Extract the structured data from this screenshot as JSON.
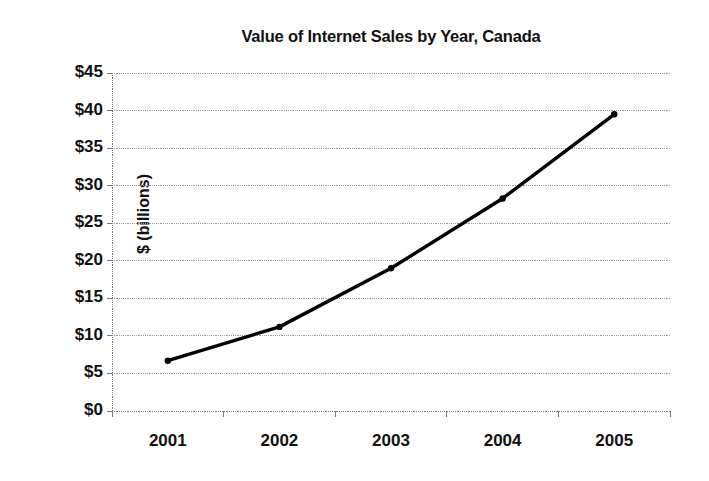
{
  "chart_data": {
    "type": "line",
    "title": "Value of Internet Sales by Year, Canada",
    "xlabel": "",
    "ylabel": "$ (billions)",
    "categories": [
      "2001",
      "2002",
      "2003",
      "2004",
      "2005"
    ],
    "values": [
      6.7,
      11.2,
      19.0,
      28.3,
      39.5
    ],
    "series": [
      {
        "name": "Value of Internet Sales",
        "values": [
          6.7,
          11.2,
          19.0,
          28.3,
          39.5
        ]
      }
    ],
    "ylim": [
      0,
      45
    ],
    "ytick_values": [
      0,
      5,
      10,
      15,
      20,
      25,
      30,
      35,
      40,
      45
    ],
    "ytick_labels": [
      "$0",
      "$5",
      "$10",
      "$15",
      "$20",
      "$25",
      "$30",
      "$35",
      "$40",
      "$45"
    ],
    "xtick_labels": [
      "2001",
      "2002",
      "2003",
      "2004",
      "2005"
    ],
    "grid": "horizontal-dotted",
    "legend": "none",
    "line_color": "#000000",
    "grid_color": "#9a9a9a",
    "axis_color": "#7a7a7a",
    "marker": "round-dot",
    "annotations": []
  }
}
